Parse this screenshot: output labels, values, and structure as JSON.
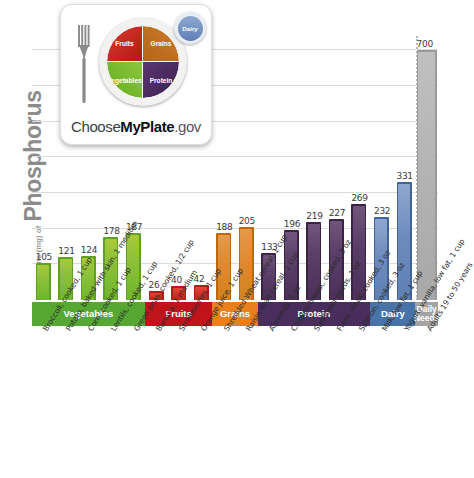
{
  "yaxis": {
    "prefix": "Milligrams (mg) of",
    "nutrient": "Phosphorus"
  },
  "logo": {
    "name": "ChooseMyPlate.gov",
    "wordmark_part1": "Choose",
    "wordmark_part2": "MyPlate",
    "wordmark_part3": ".gov",
    "quadrants": [
      {
        "label": "Fruits",
        "color": "#c8281f"
      },
      {
        "label": "Grains",
        "color": "#c07424"
      },
      {
        "label": "Vegetables",
        "color": "#7ab92e"
      },
      {
        "label": "Protein",
        "color": "#4b2b60"
      }
    ],
    "side_circle": {
      "label": "Dairy",
      "color": "#6d8cbe"
    }
  },
  "bands": [
    {
      "label": "Vegetables",
      "color": "#56a832",
      "count": 5
    },
    {
      "label": "Fruits",
      "color": "#c1141a",
      "count": 3
    },
    {
      "label": "Grains",
      "color": "#e8801e",
      "count": 2
    },
    {
      "label": "Protein",
      "color": "#492d5c",
      "count": 5
    },
    {
      "label": "Dairy",
      "color": "#4773a8",
      "count": 2
    },
    {
      "label": "Daily Needs",
      "color": "#a3a3a3",
      "count": 1
    }
  ],
  "chart_data": {
    "type": "bar",
    "title": "",
    "xlabel": "",
    "ylabel": "Milligrams (mg) of Phosphorus",
    "ylim": [
      0,
      740
    ],
    "grid": true,
    "gridlines": [
      100,
      200,
      300,
      400,
      500,
      600,
      700
    ],
    "legend": "none",
    "categories": [
      "Broccoli, cooked, 1 cup",
      "Potato, baked with skin, 1 medium",
      "Corn, cooked, 1 cup",
      "Lentils, cooked, 1 cup",
      "Green peas, cooked, 1/2 cup",
      "Banana, 1 medium",
      "Strawberries, 1 cup",
      "Orange juice, 1 cup",
      "Shredded Wheat cereal, 1 cup",
      "Raisin Bran cereal, 1 cup",
      "Almonds, 1 oz",
      "Chicken breast, cooked, 3 oz",
      "Sunflower seeds, 1 oz",
      "Flank steak, cooked, 3 oz",
      "Salmon, cooked, 3 oz",
      "Milk, low fat, 1 cup",
      "Yogurt, vanilla, low fat, 1 cup",
      "Adults 19 to 50 years"
    ],
    "values": [
      105,
      121,
      124,
      178,
      187,
      26,
      40,
      42,
      188,
      205,
      133,
      196,
      219,
      227,
      269,
      232,
      331,
      700
    ],
    "groups": [
      "veg",
      "veg",
      "veg",
      "veg",
      "veg",
      "fruit",
      "fruit",
      "fruit",
      "grain",
      "grain",
      "prot",
      "prot",
      "prot",
      "prot",
      "prot",
      "dairy",
      "dairy",
      "daily"
    ],
    "group_colors": {
      "veg": "#6fb52e",
      "fruit": "#d62f24",
      "grain": "#dd8a34",
      "prot": "#5a3f68",
      "dairy": "#6d8cbe",
      "daily": "#b3b3b3"
    }
  }
}
